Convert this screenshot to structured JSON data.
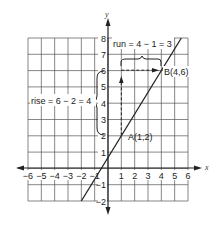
{
  "chart_data": {
    "type": "line",
    "title": "",
    "xlabel": "x",
    "ylabel": "y",
    "xlim": [
      -6,
      6
    ],
    "ylim": [
      -2,
      8
    ],
    "grid": true,
    "x_ticks": [
      "-6",
      "-5",
      "-4",
      "-3",
      "-2",
      "-1",
      "1",
      "2",
      "3",
      "4",
      "5",
      "6"
    ],
    "y_ticks": [
      "-2",
      "-1",
      "1",
      "2",
      "3",
      "4",
      "5",
      "6",
      "7",
      "8"
    ],
    "series": [
      {
        "name": "line",
        "x": [
          -2,
          5.5
        ],
        "y": [
          -2,
          8
        ]
      }
    ],
    "points": [
      {
        "label": "A(1,2)",
        "x": 1,
        "y": 2
      },
      {
        "label": "B(4,6)",
        "x": 4,
        "y": 6
      }
    ],
    "annotations": [
      {
        "text": "rise = 6 − 2 = 4",
        "type": "vertical-brace",
        "from": [
          0,
          2
        ],
        "to": [
          0,
          6
        ]
      },
      {
        "text": "run = 4 − 1 = 3",
        "type": "horizontal-brace",
        "from": [
          1,
          6.5
        ],
        "to": [
          4,
          6.5
        ]
      }
    ]
  },
  "labels": {
    "x_axis": "x",
    "y_axis": "y",
    "point_a": "A(1,2)",
    "point_b": "B(4,6)",
    "rise": "rise = 6 − 2 = 4",
    "run": "run = 4 − 1 = 3"
  }
}
